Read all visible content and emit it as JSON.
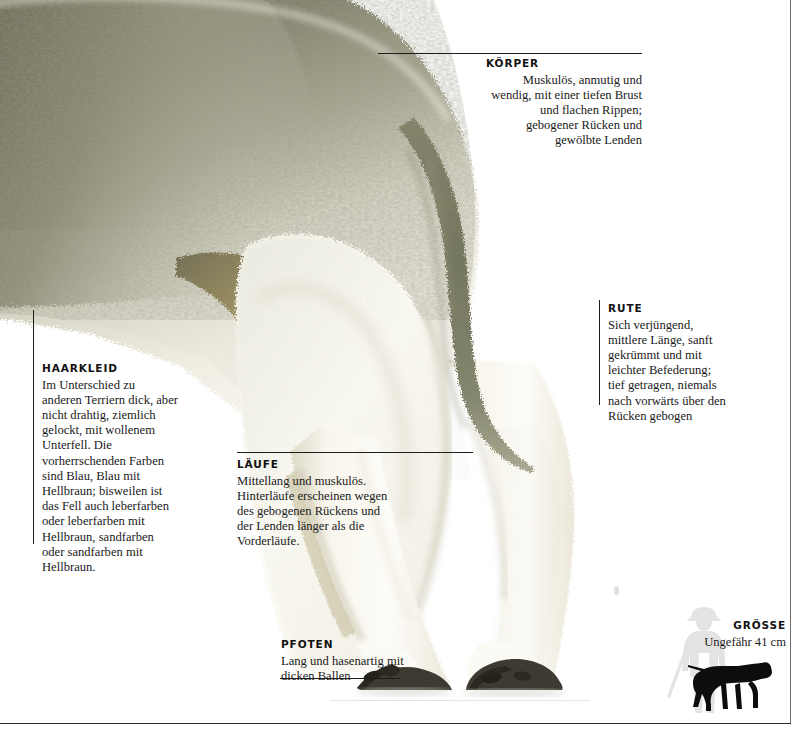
{
  "page": {
    "language": "de"
  },
  "callouts": [
    {
      "id": "koerper",
      "heading": "KÖRPER",
      "body": "Muskulös, anmutig und wendig, mit einer tiefen Brust und flachen Rippen; gebogener Rücken und gewölbte Lenden"
    },
    {
      "id": "rute",
      "heading": "RUTE",
      "body": "Sich verjüngend, mittlere Länge, sanft gekrümmt und mit leichter Befederung; tief getragen, niemals nach vorwärts über den Rücken gebogen"
    },
    {
      "id": "haarkleid",
      "heading": "HAARKLEID",
      "body": "Im Unterschied zu anderen Terriern dick, aber nicht drahtig, ziemlich gelockt, mit wollenem Unterfell. Die vorherrschenden Farben sind Blau, Blau mit Hellbraun; bisweilen ist das Fell auch leberfarben oder leberfarben mit Hellbraun, sandfarben oder sandfarben mit Hellbraun."
    },
    {
      "id": "laeufe",
      "heading": "LÄUFE",
      "body": "Mittellang und muskulös. Hinterläufe erscheinen wegen des gebogenen Rückens und der Lenden länger als die Vorderläufe."
    },
    {
      "id": "pfoten",
      "heading": "PFOTEN",
      "body": "Lang und hasenartig mit dicken Ballen"
    },
    {
      "id": "groesse",
      "heading": "GRÖSSE",
      "body": "Ungefähr 41 cm"
    }
  ],
  "colors": {
    "fur_dark": "#76765f",
    "fur_mid": "#b8b6a4",
    "fur_light": "#f3f1e8",
    "fur_cream": "#fbf9f2",
    "tail": "#7b7c68",
    "claw": "#3a382f",
    "rule": "#1d1d1d",
    "page_border": "#6e6e6e",
    "silhouette_human": "#e2e2e2",
    "silhouette_dog": "#0d0d0d",
    "text": "#1a1a1a"
  },
  "graphics": {
    "photo_alt": "bedlington-terrier-hindquarters-photo",
    "human_silhouette": "human-silhouette-icon",
    "dog_silhouette": "dog-silhouette-icon"
  }
}
